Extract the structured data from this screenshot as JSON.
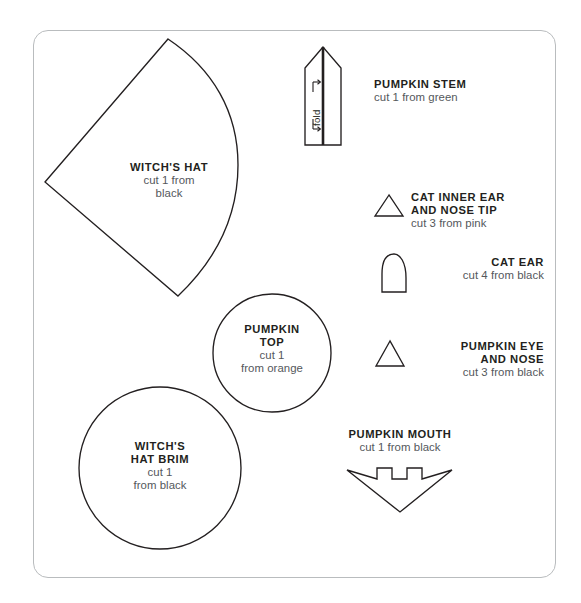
{
  "page": {
    "background_color": "#ffffff",
    "border_color": "#b9bcbe",
    "ink_color": "#231f20",
    "text_color": "#54585c"
  },
  "templates": [
    {
      "id": "witchs-hat",
      "shape": "cone-pie-slice",
      "title": "WITCH'S HAT",
      "sub_line_1": "cut 1 from",
      "sub_line_2": "black",
      "quantity": 1,
      "material_color": "black"
    },
    {
      "id": "pumpkin-stem",
      "shape": "pentagon-with-fold",
      "title": "PUMPKIN STEM",
      "sub_line_1": "cut 1 from green",
      "quantity": 1,
      "material_color": "green",
      "fold_label": "fold"
    },
    {
      "id": "cat-inner-ear-and-nose-tip",
      "shape": "triangle",
      "title_line_1": "CAT INNER EAR",
      "title_line_2": "AND NOSE TIP",
      "sub_line_1": "cut 3 from pink",
      "quantity": 3,
      "material_color": "pink"
    },
    {
      "id": "cat-ear",
      "shape": "dome",
      "title": "CAT EAR",
      "sub_line_1": "cut 4 from black",
      "quantity": 4,
      "material_color": "black"
    },
    {
      "id": "pumpkin-eye-and-nose",
      "shape": "triangle",
      "title_line_1": "PUMPKIN EYE",
      "title_line_2": "AND NOSE",
      "sub_line_1": "cut 3 from black",
      "quantity": 3,
      "material_color": "black"
    },
    {
      "id": "pumpkin-top",
      "shape": "circle",
      "title_line_1": "PUMPKIN",
      "title_line_2": "TOP",
      "sub_line_1": "cut 1",
      "sub_line_2": "from orange",
      "quantity": 1,
      "material_color": "orange"
    },
    {
      "id": "witchs-hat-brim",
      "shape": "circle",
      "title_line_1": "WITCH'S",
      "title_line_2": "HAT BRIM",
      "sub_line_1": "cut 1",
      "sub_line_2": "from black",
      "quantity": 1,
      "material_color": "black"
    },
    {
      "id": "pumpkin-mouth",
      "shape": "jagged-arrow",
      "title": "PUMPKIN MOUTH",
      "sub_line_1": "cut 1 from black",
      "quantity": 1,
      "material_color": "black"
    }
  ]
}
